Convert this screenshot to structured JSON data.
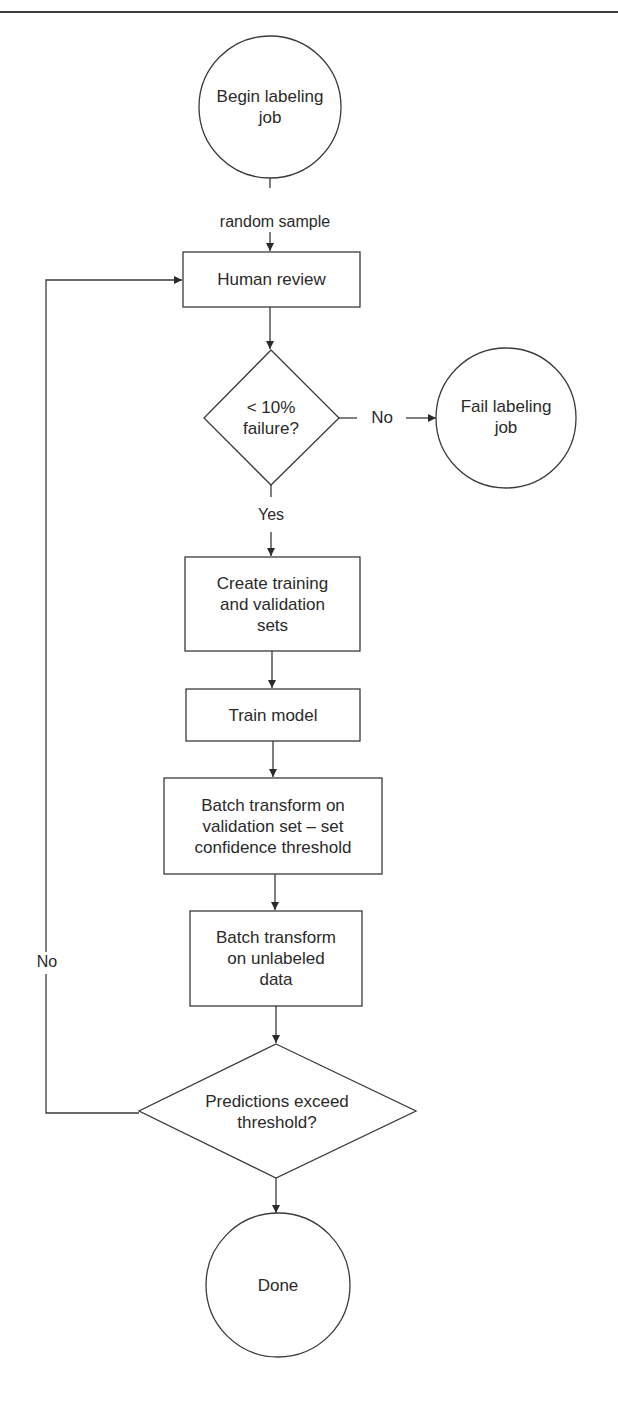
{
  "colors": {
    "stroke": "#3a3a3a",
    "text": "#2a2a2a",
    "background": "#ffffff"
  },
  "nodes": {
    "start": {
      "type": "terminal-circle",
      "label": "Begin labeling\njob"
    },
    "human_review": {
      "type": "process",
      "label": "Human review"
    },
    "failure_check": {
      "type": "decision",
      "label": "< 10%\nfailure?"
    },
    "fail_job": {
      "type": "terminal-circle",
      "label": "Fail labeling\njob"
    },
    "create_sets": {
      "type": "process",
      "label": "Create training\nand validation\nsets"
    },
    "train_model": {
      "type": "process",
      "label": "Train model"
    },
    "batch_validation": {
      "type": "process",
      "label": "Batch transform on\nvalidation set – set\nconfidence threshold"
    },
    "batch_unlabeled": {
      "type": "process",
      "label": "Batch transform\non unlabeled\ndata"
    },
    "threshold_check": {
      "type": "decision",
      "label": "Predictions exceed\nthreshold?"
    },
    "done": {
      "type": "terminal-circle",
      "label": "Done"
    }
  },
  "edges": {
    "start_to_review": {
      "from": "start",
      "to": "human_review",
      "label": "random sample"
    },
    "review_to_check": {
      "from": "human_review",
      "to": "failure_check",
      "label": ""
    },
    "check_to_fail": {
      "from": "failure_check",
      "to": "fail_job",
      "label": "No"
    },
    "check_to_sets": {
      "from": "failure_check",
      "to": "create_sets",
      "label": "Yes"
    },
    "sets_to_train": {
      "from": "create_sets",
      "to": "train_model",
      "label": ""
    },
    "train_to_batchval": {
      "from": "train_model",
      "to": "batch_validation",
      "label": ""
    },
    "batchval_to_batchunl": {
      "from": "batch_validation",
      "to": "batch_unlabeled",
      "label": ""
    },
    "batchunl_to_threshold": {
      "from": "batch_unlabeled",
      "to": "threshold_check",
      "label": ""
    },
    "threshold_to_review": {
      "from": "threshold_check",
      "to": "human_review",
      "label": "No"
    },
    "threshold_to_done": {
      "from": "threshold_check",
      "to": "done",
      "label": ""
    }
  }
}
